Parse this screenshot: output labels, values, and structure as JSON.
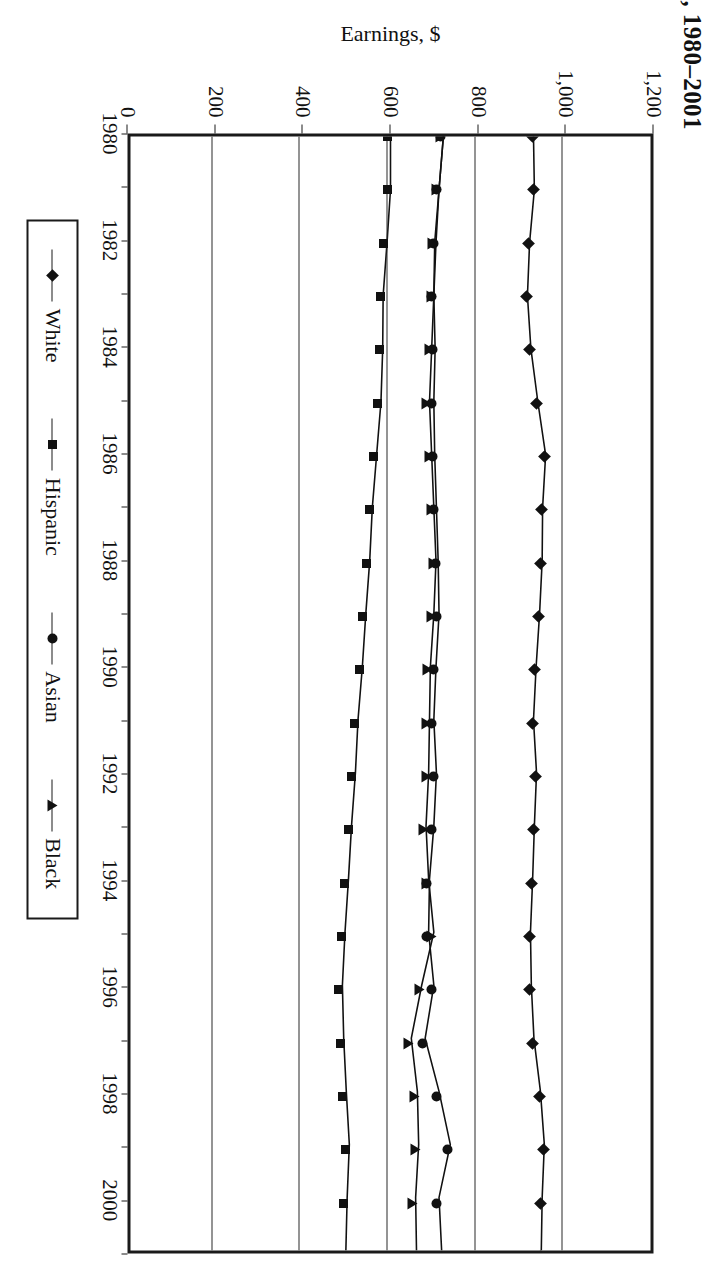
{
  "title": ", 1980–2001",
  "axis": {
    "y_label": "Earnings, $",
    "y_ticks": [
      "1,200",
      "1,000",
      "800",
      "600",
      "400",
      "200",
      "0"
    ],
    "x_ticks": [
      "1980",
      "1982",
      "1984",
      "1986",
      "1988",
      "1990",
      "1992",
      "1994",
      "1996",
      "1998",
      "2000"
    ]
  },
  "legend": {
    "items": [
      {
        "label": "White",
        "marker": "diamond"
      },
      {
        "label": "Hispanic",
        "marker": "square"
      },
      {
        "label": "Asian",
        "marker": "circle"
      },
      {
        "label": "Black",
        "marker": "triangle"
      }
    ]
  },
  "chart_data": {
    "type": "line",
    "title": ", 1980–2001",
    "xlabel": "",
    "ylabel": "Earnings, $",
    "ylim": [
      0,
      1200
    ],
    "xlim": [
      1980,
      2001
    ],
    "grid": true,
    "legend_position": "bottom",
    "x": [
      1980,
      1981,
      1982,
      1983,
      1984,
      1985,
      1986,
      1987,
      1988,
      1989,
      1990,
      1991,
      1992,
      1993,
      1994,
      1995,
      1996,
      1997,
      1998,
      1999,
      2000,
      2001
    ],
    "series": [
      {
        "name": "White",
        "marker": "diamond",
        "values": [
          930,
          932,
          921,
          916,
          924,
          940,
          958,
          951,
          950,
          944,
          936,
          930,
          937,
          932,
          928,
          923,
          925,
          931,
          946,
          955,
          950,
          948
        ]
      },
      {
        "name": "Hispanic",
        "marker": "square",
        "values": [
          600,
          600,
          592,
          583,
          582,
          578,
          568,
          558,
          552,
          543,
          535,
          525,
          519,
          510,
          503,
          495,
          489,
          492,
          498,
          505,
          500,
          497
        ]
      },
      {
        "name": "Asian",
        "marker": "circle",
        "values": [
          722,
          712,
          705,
          700,
          703,
          700,
          702,
          706,
          710,
          712,
          705,
          700,
          706,
          700,
          690,
          688,
          700,
          680,
          712,
          738,
          712,
          718
        ]
      },
      {
        "name": "Black",
        "marker": "triangle",
        "values": [
          722,
          712,
          702,
          700,
          695,
          690,
          695,
          700,
          705,
          700,
          692,
          690,
          688,
          682,
          688,
          700,
          672,
          648,
          662,
          665,
          658,
          660
        ]
      }
    ]
  }
}
